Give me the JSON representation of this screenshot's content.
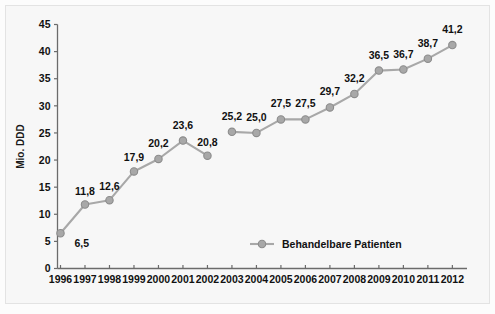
{
  "chart_data": {
    "type": "line",
    "title": "",
    "subtitle": "",
    "xlabel": "",
    "ylabel": "Mio. DDD",
    "ylim": [
      0,
      45
    ],
    "y_ticks": [
      0,
      5,
      10,
      15,
      20,
      25,
      30,
      35,
      40,
      45
    ],
    "grid": false,
    "legend_position": "bottom-right",
    "categories": [
      "1996",
      "1997",
      "1998",
      "1999",
      "2000",
      "2001",
      "2002",
      "2003",
      "2004",
      "2005",
      "2006",
      "2007",
      "2008",
      "2009",
      "2010",
      "2011",
      "2012"
    ],
    "series": [
      {
        "name": "Behandelbare Patienten",
        "values": [
          6.5,
          11.8,
          12.6,
          17.9,
          20.2,
          23.6,
          20.8,
          25.2,
          25.0,
          27.5,
          27.5,
          29.7,
          32.2,
          36.5,
          36.7,
          38.7,
          41.2
        ],
        "value_labels": [
          "6,5",
          "11,8",
          "12,6",
          "17,9",
          "20,2",
          "23,6",
          "20,8",
          "25,2",
          "25,0",
          "27,5",
          "27,5",
          "29,7",
          "32,2",
          "36,5",
          "36,7",
          "38,7",
          "41,2"
        ],
        "line_breaks_after": [
          "2002"
        ],
        "color": "#a8a8a8",
        "marker_color": "#a8a8a8",
        "marker_edge_color": "#8c8c8c"
      }
    ],
    "label_offsets_y": [
      14,
      -10,
      -10,
      -10,
      -12,
      -12,
      -10,
      -12,
      -12,
      -12,
      -12,
      -12,
      -12,
      -12,
      -12,
      -12,
      -12
    ],
    "label_offsets_x": [
      14,
      0,
      0,
      0,
      0,
      0,
      0,
      0,
      0,
      0,
      0,
      0,
      0,
      0,
      0,
      0,
      0
    ]
  },
  "axis": {
    "y_tick_labels": [
      "0",
      "5",
      "10",
      "15",
      "20",
      "25",
      "30",
      "35",
      "40",
      "45"
    ],
    "x_tick_labels": [
      "1996",
      "1997",
      "1998",
      "1999",
      "2000",
      "2001",
      "2002",
      "2003",
      "2004",
      "2005",
      "2006",
      "2007",
      "2008",
      "2009",
      "2010",
      "2011",
      "2012"
    ],
    "y_axis_title": "Mio. DDD"
  },
  "legend": {
    "entries": [
      {
        "label": "Behandelbare Patienten",
        "color": "#a8a8a8"
      }
    ]
  },
  "colors": {
    "series": "#a8a8a8",
    "marker_edge": "#8c8c8c",
    "axis": "#6b6b6b",
    "text": "#111111",
    "plot_background": "#f7f7f7",
    "frame_border": "#e3e3e3",
    "page_background": "#fcfcfc"
  }
}
